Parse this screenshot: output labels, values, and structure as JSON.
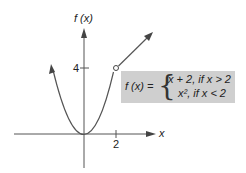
{
  "figure": {
    "y_axis_label": "f (x)",
    "x_axis_label": "x",
    "y_tick_label": "4",
    "x_tick_label": "2",
    "function_label": "f (x) =",
    "case_1": "x + 2, if  x > 2",
    "case_2": "x², if  x < 2",
    "box_color": "#cfcfcf",
    "curve_color": "#555555"
  }
}
